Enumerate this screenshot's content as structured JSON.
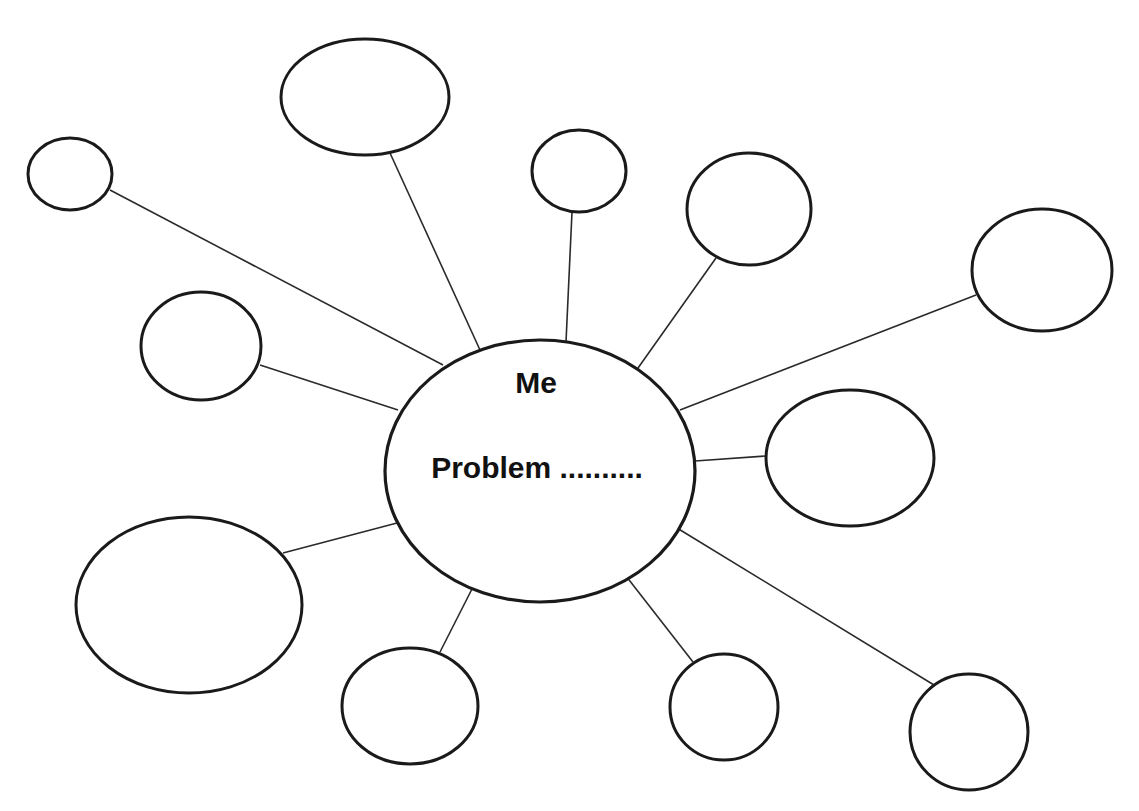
{
  "diagram": {
    "type": "mind-map",
    "colors": {
      "stroke": "#1a1a1a",
      "line": "#2a2a2a",
      "text": "#111111",
      "background": "#ffffff"
    },
    "hub": {
      "cx": 540,
      "cy": 471,
      "rx": 155,
      "ry": 131,
      "title": "Me",
      "title_pos": [
        536,
        393
      ],
      "subtitle": "Problem ..........",
      "subtitle_pos": [
        537,
        478
      ]
    },
    "nodes": [
      {
        "id": "top-left-small",
        "cx": 70,
        "cy": 174,
        "rx": 42,
        "ry": 36,
        "line": [
          110,
          190,
          443,
          365
        ],
        "label": ""
      },
      {
        "id": "top-large",
        "cx": 365,
        "cy": 97,
        "rx": 84,
        "ry": 58,
        "line": [
          390,
          153,
          480,
          350
        ],
        "label": ""
      },
      {
        "id": "top-small",
        "cx": 579,
        "cy": 171,
        "rx": 47,
        "ry": 41,
        "line": [
          572,
          212,
          566,
          342
        ],
        "label": ""
      },
      {
        "id": "top-right",
        "cx": 749,
        "cy": 209,
        "rx": 62,
        "ry": 56,
        "line": [
          716,
          258,
          638,
          368
        ],
        "label": ""
      },
      {
        "id": "far-right",
        "cx": 1042,
        "cy": 270,
        "rx": 70,
        "ry": 61,
        "line": [
          976,
          295,
          680,
          410
        ],
        "label": ""
      },
      {
        "id": "left-middle",
        "cx": 201,
        "cy": 346,
        "rx": 60,
        "ry": 54,
        "line": [
          260,
          365,
          398,
          410
        ],
        "label": ""
      },
      {
        "id": "right-middle",
        "cx": 850,
        "cy": 458,
        "rx": 84,
        "ry": 68,
        "line": [
          766,
          456,
          695,
          461
        ],
        "label": ""
      },
      {
        "id": "bottom-left-large",
        "cx": 189,
        "cy": 605,
        "rx": 113,
        "ry": 88,
        "line": [
          283,
          553,
          397,
          523
        ],
        "label": ""
      },
      {
        "id": "bottom-small",
        "cx": 410,
        "cy": 706,
        "rx": 68,
        "ry": 58,
        "line": [
          440,
          652,
          473,
          587
        ],
        "label": ""
      },
      {
        "id": "bottom-middle",
        "cx": 724,
        "cy": 707,
        "rx": 54,
        "ry": 53,
        "line": [
          693,
          662,
          626,
          576
        ],
        "label": ""
      },
      {
        "id": "bottom-right",
        "cx": 969,
        "cy": 732,
        "rx": 59,
        "ry": 58,
        "line": [
          934,
          685,
          677,
          528
        ],
        "label": ""
      }
    ]
  }
}
